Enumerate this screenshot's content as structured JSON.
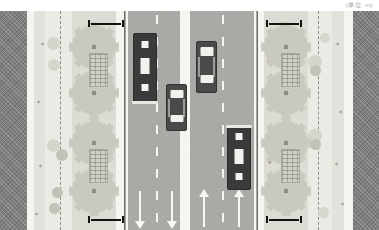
{
  "caption": {
    "text": "(单位: m)"
  },
  "drawing": {
    "title": "urban-street-cross-section-plan",
    "colors": {
      "building": "#7e7e7e",
      "plaza": "#ebebe6",
      "greenbelt": "#dcdcd4",
      "walkway": "#bdbdb6",
      "roadway": "#a8a8a5",
      "marking": "#f6f6f3",
      "vehicle_dark": "#3a3a3a",
      "vehicle_glass": "#f1f1ec",
      "tree_canopy": "#c9c9bf",
      "dimension": "#141414"
    },
    "bands": [
      {
        "name": "left-building-block",
        "label": "building",
        "x": 0,
        "width": 27,
        "fill": "bldg"
      },
      {
        "name": "left-setback-strip",
        "label": "setback",
        "x": 27,
        "width": 7,
        "fill": "kerb"
      },
      {
        "name": "left-plaza",
        "label": "plaza",
        "x": 34,
        "width": 11,
        "fill": "plaza2"
      },
      {
        "name": "left-open-space",
        "label": "open space",
        "x": 45,
        "width": 27,
        "fill": "plaza"
      },
      {
        "name": "left-green-belt",
        "label": "green belt",
        "x": 72,
        "width": 44,
        "fill": "grassy"
      },
      {
        "name": "left-footway",
        "label": "footway",
        "x": 116,
        "width": 9,
        "fill": "kerb"
      },
      {
        "name": "left-carriageway",
        "label": "carriageway",
        "x": 125,
        "width": 56,
        "fill": "road"
      },
      {
        "name": "central-median",
        "label": "median",
        "x": 181,
        "width": 9,
        "fill": "kerb"
      },
      {
        "name": "right-carriageway",
        "label": "carriageway",
        "x": 190,
        "width": 67,
        "fill": "road"
      },
      {
        "name": "right-footway",
        "label": "footway",
        "x": 257,
        "width": 7,
        "fill": "kerb"
      },
      {
        "name": "right-green-belt",
        "label": "green belt",
        "x": 264,
        "width": 44,
        "fill": "grassy"
      },
      {
        "name": "right-open-space",
        "label": "open space",
        "x": 308,
        "width": 24,
        "fill": "plaza"
      },
      {
        "name": "right-plaza",
        "label": "plaza",
        "x": 332,
        "width": 12,
        "fill": "plaza2"
      },
      {
        "name": "right-setback-strip",
        "label": "setback",
        "x": 344,
        "width": 9,
        "fill": "kerb"
      },
      {
        "name": "right-building-block",
        "label": "building",
        "x": 353,
        "width": 26,
        "fill": "bldg"
      }
    ],
    "vehicles": [
      {
        "name": "bus-northbound-outer",
        "type": "bus",
        "x": 133,
        "y": 22,
        "w": 22,
        "h": 68,
        "heading": "down"
      },
      {
        "name": "car-northbound-inner",
        "type": "car",
        "x": 166,
        "y": 73,
        "w": 19,
        "h": 45,
        "heading": "down"
      },
      {
        "name": "car-southbound-inner",
        "type": "car",
        "x": 196,
        "y": 30,
        "w": 19,
        "h": 50,
        "heading": "up"
      },
      {
        "name": "bus-southbound-outer",
        "type": "bus",
        "x": 227,
        "y": 115,
        "w": 22,
        "h": 62,
        "heading": "up"
      }
    ],
    "lane_arrows": [
      {
        "name": "arrow-lane-1",
        "direction": "down",
        "x": 133,
        "y": 178
      },
      {
        "name": "arrow-lane-2",
        "direction": "down",
        "x": 165,
        "y": 178
      },
      {
        "name": "arrow-lane-3",
        "direction": "up",
        "x": 197,
        "y": 178
      },
      {
        "name": "arrow-lane-4",
        "direction": "up",
        "x": 232,
        "y": 178
      }
    ],
    "dimension_bars": [
      {
        "name": "dimension-left-top",
        "x": 88,
        "y": 9,
        "w": 36
      },
      {
        "name": "dimension-left-bottom",
        "x": 88,
        "y": 205,
        "w": 36
      },
      {
        "name": "dimension-right-top",
        "x": 266,
        "y": 9,
        "w": 36
      },
      {
        "name": "dimension-right-bottom",
        "x": 266,
        "y": 205,
        "w": 36
      }
    ],
    "trees_left": [
      {
        "x": 72,
        "y": 14
      },
      {
        "x": 72,
        "y": 60
      },
      {
        "x": 72,
        "y": 110
      },
      {
        "x": 72,
        "y": 158
      }
    ],
    "trees_right": [
      {
        "x": 264,
        "y": 14
      },
      {
        "x": 264,
        "y": 60
      },
      {
        "x": 264,
        "y": 110
      },
      {
        "x": 264,
        "y": 158
      }
    ],
    "planting_beds": [
      {
        "name": "planting-bed-left-upper",
        "x": 89,
        "y": 42,
        "w": 17,
        "h": 32
      },
      {
        "name": "planting-bed-left-lower",
        "x": 89,
        "y": 138,
        "w": 17,
        "h": 32
      },
      {
        "name": "planting-bed-right-upper",
        "x": 281,
        "y": 42,
        "w": 17,
        "h": 32
      },
      {
        "name": "planting-bed-right-lower",
        "x": 281,
        "y": 138,
        "w": 17,
        "h": 32
      }
    ]
  }
}
